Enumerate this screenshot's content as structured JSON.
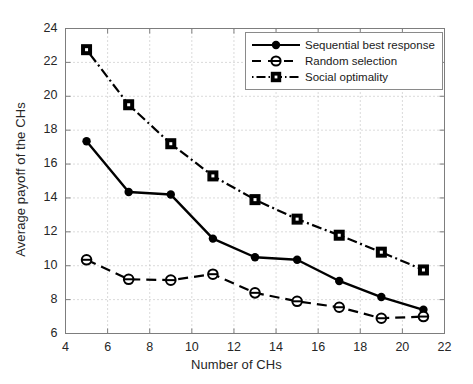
{
  "chart_data": {
    "type": "line",
    "title": "",
    "xlabel": "Number of CHs",
    "ylabel": "Average payoff of the CHs",
    "xlim": [
      4,
      22
    ],
    "ylim": [
      6,
      24
    ],
    "xticks": [
      4,
      6,
      8,
      10,
      12,
      14,
      16,
      18,
      20,
      22
    ],
    "yticks": [
      6,
      8,
      10,
      12,
      14,
      16,
      18,
      20,
      22,
      24
    ],
    "grid": true,
    "legend_position": "top-right",
    "x": [
      5,
      7,
      9,
      11,
      13,
      15,
      17,
      19,
      21
    ],
    "series": [
      {
        "name": "Sequential best response",
        "marker": "filled-diamond",
        "linestyle": "solid",
        "color": "#000000",
        "values": [
          17.35,
          14.35,
          14.2,
          11.6,
          10.5,
          10.35,
          9.1,
          8.15,
          7.4
        ]
      },
      {
        "name": "Random selection",
        "marker": "circle-bar",
        "linestyle": "dashed",
        "color": "#000000",
        "values": [
          10.35,
          9.2,
          9.15,
          9.5,
          8.4,
          7.9,
          7.55,
          6.9,
          7.0
        ]
      },
      {
        "name": "Social optimality",
        "marker": "square-dot",
        "linestyle": "dashdot",
        "color": "#000000",
        "values": [
          22.75,
          19.5,
          17.2,
          15.3,
          13.9,
          12.75,
          11.8,
          10.8,
          9.75
        ]
      }
    ]
  },
  "legend": {
    "items": [
      {
        "label": "Sequential best response"
      },
      {
        "label": "Random selection"
      },
      {
        "label": "Social optimality"
      }
    ]
  },
  "axes": {
    "frame_color": "#7d7d7d",
    "grid_color": "#b5b5b5"
  }
}
